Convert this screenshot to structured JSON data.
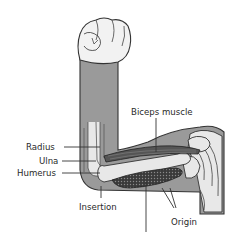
{
  "diagram": {
    "labels": {
      "biceps": "Biceps muscle",
      "radius": "Radius",
      "ulna": "Ulna",
      "humerus": "Humerus",
      "insertion": "Insertion",
      "origin": "Origin"
    },
    "colors": {
      "skin": "#9a9a9a",
      "bone": "#e8e8e8",
      "outline": "#333333",
      "muscle": "#555555",
      "hand": "#f2f2f2",
      "background": "#ffffff"
    }
  }
}
